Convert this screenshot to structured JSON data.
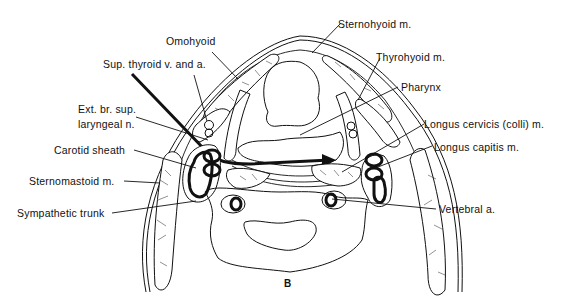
{
  "figure": {
    "panel_label": "B",
    "labels": [
      {
        "id": "omohyoid",
        "text": "Omohyoid"
      },
      {
        "id": "sup_thyroid",
        "text": "Sup.  thyroid v. and a."
      },
      {
        "id": "ext_br_1",
        "text": "Ext. br. sup."
      },
      {
        "id": "ext_br_2",
        "text": "laryngeal  n."
      },
      {
        "id": "carotid_sheath",
        "text": "Carotid sheath"
      },
      {
        "id": "sternomastoid",
        "text": "Sternomastoid  m."
      },
      {
        "id": "sympathetic",
        "text": "Sympathetic  trunk"
      },
      {
        "id": "sternohyoid",
        "text": "Sternohyoid  m."
      },
      {
        "id": "thyrohyoid",
        "text": "Thyrohyoid  m."
      },
      {
        "id": "pharynx",
        "text": "Pharynx"
      },
      {
        "id": "longus_cervicis",
        "text": "Longus  cervicis (colli)  m."
      },
      {
        "id": "longus_capitis",
        "text": "Longus  capitis m."
      },
      {
        "id": "vertebral",
        "text": "Vertebral  a."
      }
    ]
  }
}
